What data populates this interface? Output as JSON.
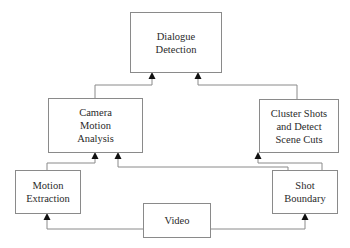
{
  "diagram": {
    "colors": {
      "line": "#8a8a8a",
      "arrow": "#111111",
      "text": "#2a2a2a",
      "background": "#ffffff"
    },
    "nodes": [
      {
        "id": "dialogue",
        "lines": [
          "Dialogue",
          "Detection"
        ]
      },
      {
        "id": "camera",
        "lines": [
          "Camera",
          "Motion",
          "Analysis"
        ]
      },
      {
        "id": "cluster",
        "lines": [
          "Cluster Shots",
          "and Detect",
          "Scene Cuts"
        ]
      },
      {
        "id": "motion",
        "lines": [
          "Motion",
          "Extraction"
        ]
      },
      {
        "id": "shot",
        "lines": [
          "Shot",
          "Boundary"
        ]
      },
      {
        "id": "video",
        "lines": [
          "Video"
        ]
      }
    ],
    "edges": [
      {
        "from": "Video",
        "to": "Motion Extraction"
      },
      {
        "from": "Video",
        "to": "Shot Boundary"
      },
      {
        "from": "Motion Extraction",
        "to": "Camera Motion Analysis"
      },
      {
        "from": "Shot Boundary",
        "to": "Camera Motion Analysis"
      },
      {
        "from": "Shot Boundary",
        "to": "Cluster Shots and Detect Scene Cuts"
      },
      {
        "from": "Camera Motion Analysis",
        "to": "Dialogue Detection"
      },
      {
        "from": "Cluster Shots and Detect Scene Cuts",
        "to": "Dialogue Detection"
      }
    ]
  }
}
